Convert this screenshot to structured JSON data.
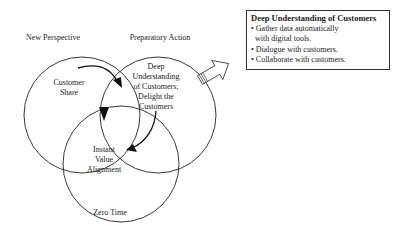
{
  "diagram": {
    "circles": [
      {
        "title": "New Perspective",
        "content": "Customer Share"
      },
      {
        "title": "Preparatory Action",
        "content": "Deep Understanding of Customers; Delight the Customers"
      },
      {
        "title": "Zero Time",
        "content": "Instant Value Alignment"
      }
    ],
    "labels": {
      "new_perspective": "New Perspective",
      "preparatory_action": "Preparatory Action",
      "zero_time": "Zero Time",
      "customer": "Customer",
      "share": "Share",
      "deep": "Deep",
      "understanding": "Understanding",
      "of_customers": "of Customers;",
      "delight_the": "Delight the",
      "customers": "Customers",
      "instant": "Instant",
      "value": "Value",
      "alignment": "Alignment"
    },
    "callout": {
      "title": "Deep Understanding of Customers",
      "bullets": [
        "• Gather data automatically",
        "with digital tools.",
        "• Dialogue with customers.",
        "• Collaborate with customers."
      ]
    },
    "icons": [
      "curved-arrow-icon",
      "hollow-block-arrow-icon",
      "triangle-marker-icon"
    ]
  }
}
